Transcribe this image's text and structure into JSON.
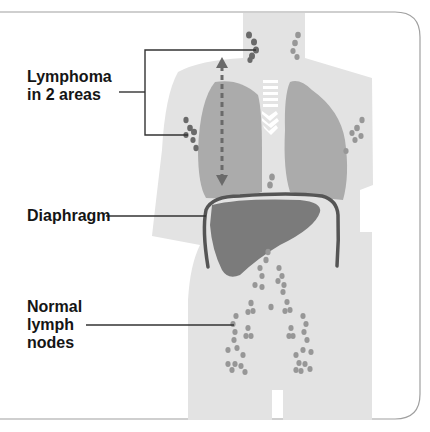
{
  "labels": {
    "lymphoma": [
      "Lymphoma",
      "in 2 areas"
    ],
    "diaphragm": "Diaphragm",
    "normal_nodes": [
      "Normal",
      "lymph",
      "nodes"
    ]
  },
  "colors": {
    "body": "#e2e2e2",
    "lungs": "#aaaaaa",
    "liver": "#7a7a7a",
    "diaphragm": "#555555",
    "affected_node": "#6e6e6e",
    "normal_node": "#9a9a9a",
    "arrow": "#6a6a6a",
    "leader_line": "#333333",
    "frame": "#9a9a9a"
  }
}
